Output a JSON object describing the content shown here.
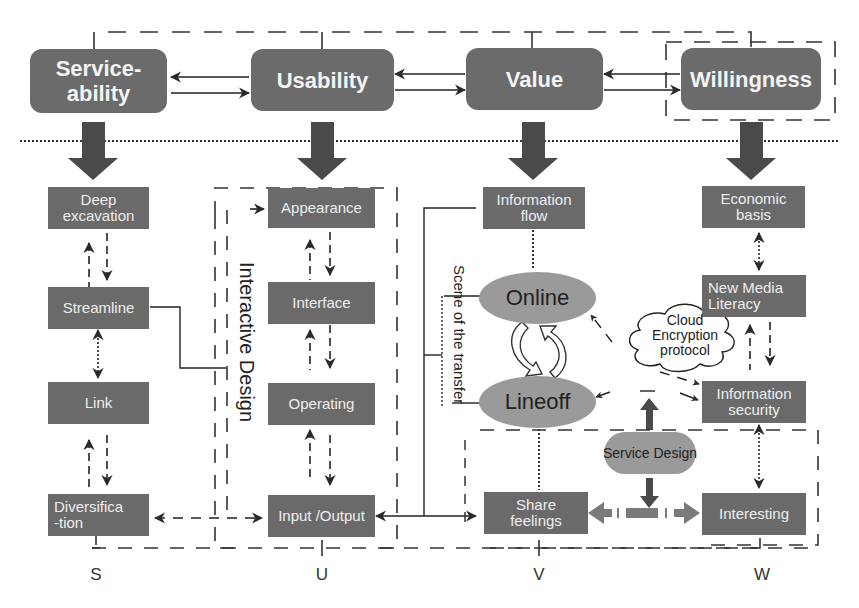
{
  "diagram": {
    "top_nodes": [
      {
        "id": "serviceability",
        "label_line1": "Service-",
        "label_line2": "ability"
      },
      {
        "id": "usability",
        "label": "Usability"
      },
      {
        "id": "value",
        "label": "Value"
      },
      {
        "id": "willingness",
        "label": "Willingness"
      }
    ],
    "columns": {
      "S": {
        "axis_label": "S",
        "boxes": [
          {
            "line1": "Deep",
            "line2": "excavation"
          },
          {
            "label": "Streamline"
          },
          {
            "label": "Link"
          },
          {
            "line1": "Diversifica",
            "line2": "-tion"
          }
        ]
      },
      "U": {
        "axis_label": "U",
        "group_label": "Interactive Design",
        "boxes": [
          {
            "label": "Appearance"
          },
          {
            "label": "Interface"
          },
          {
            "label": "Operating"
          },
          {
            "label": "Input /Output"
          }
        ]
      },
      "V": {
        "axis_label": "V",
        "group_label": "Scene of the transfer",
        "boxes": [
          {
            "line1": "Information",
            "line2": "flow"
          },
          {
            "line1": "Share",
            "line2": "feelings"
          }
        ],
        "ellipses": [
          {
            "label": "Online"
          },
          {
            "label": "Lineoff"
          }
        ]
      },
      "W": {
        "axis_label": "W",
        "boxes": [
          {
            "line1": "Economic",
            "line2": "basis"
          },
          {
            "line1": "New Media",
            "line2": "Literacy"
          },
          {
            "line1": "Information",
            "line2": "security"
          },
          {
            "label": "Interesting"
          }
        ]
      }
    },
    "cloud": {
      "line1": "Cloud",
      "line2": "Encryption",
      "line3": "protocol"
    },
    "service_design": {
      "label": "Service Design"
    },
    "colors": {
      "box_fill": "#6a6a6a",
      "ellipse_fill": "#9a9a9a",
      "arrow": "#333333",
      "text_light": "#eeeeee"
    }
  }
}
